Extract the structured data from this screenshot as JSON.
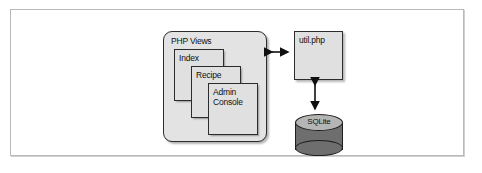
{
  "diagram": {
    "colors": {
      "box_fill": "#e0e0e0",
      "container_fill": "#e3e3e3",
      "cylinder_top": "#b5b5b5",
      "cylinder_body": "#6e6e6e",
      "stroke": "#2c2c2c",
      "frame_border": "#b9b9b9",
      "background": "#ffffff"
    },
    "container": {
      "label": "PHP Views",
      "cards": [
        {
          "label": "Index"
        },
        {
          "label": "Recipe"
        },
        {
          "label": "Admin\nConsole"
        }
      ]
    },
    "nodes": {
      "util": {
        "label": "util.php"
      },
      "database": {
        "label": "SQLite"
      }
    },
    "connectors": [
      {
        "name": "views-to-util",
        "from": "PHP Views",
        "to": "util.php",
        "direction": "bidirectional",
        "orientation": "horizontal"
      },
      {
        "name": "util-to-sqlite",
        "from": "util.php",
        "to": "SQLite",
        "direction": "bidirectional",
        "orientation": "vertical"
      }
    ]
  }
}
